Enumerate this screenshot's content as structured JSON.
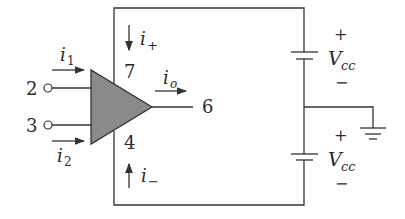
{
  "diagram": {
    "type": "op-amp circuit with dual power supply",
    "colors": {
      "wire": "#333333",
      "opamp_fill": "#8a8a8a",
      "text": "#2a2a2a"
    },
    "terminals": {
      "inverting_input": "2",
      "noninverting_input": "3",
      "positive_supply": "7",
      "negative_supply": "4",
      "output": "6"
    },
    "currents": {
      "i1": {
        "base": "i",
        "sub": "1"
      },
      "i2": {
        "base": "i",
        "sub": "2"
      },
      "i_plus": {
        "base": "i",
        "sub": "+"
      },
      "i_minus": {
        "base": "i",
        "sub": "−"
      },
      "i_o": {
        "base": "i",
        "sub": "o"
      }
    },
    "sources": {
      "top": {
        "name": "V",
        "sub": "cc",
        "plus": "+",
        "minus": "−"
      },
      "bottom": {
        "name": "V",
        "sub": "cc",
        "plus": "+",
        "minus": "−"
      }
    }
  }
}
